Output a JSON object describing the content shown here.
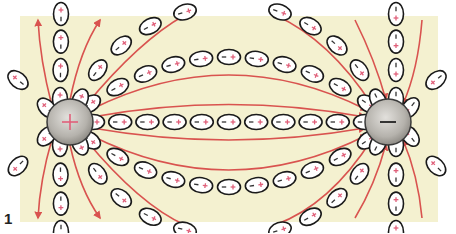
{
  "figure": {
    "number": "1"
  },
  "colors": {
    "background": "#f4f1d0",
    "field_line": "#d9534f",
    "molecule_outline": "#1a1a1a",
    "molecule_fill": "#ffffff",
    "plus_sign": "#e0607a",
    "minus_sign": "#333333",
    "charge_fill": "#b9b6b0"
  },
  "charges": [
    {
      "id": "positive",
      "sign": "+",
      "label": "+"
    },
    {
      "id": "negative",
      "sign": "-",
      "label": "−"
    }
  ],
  "molecule": {
    "plus_label": "+",
    "minus_label": "−"
  },
  "field_lines": {
    "direction": "from positive charge to negative charge",
    "count_between": 4,
    "count_outward_left": 4,
    "count_inward_right": 4
  }
}
